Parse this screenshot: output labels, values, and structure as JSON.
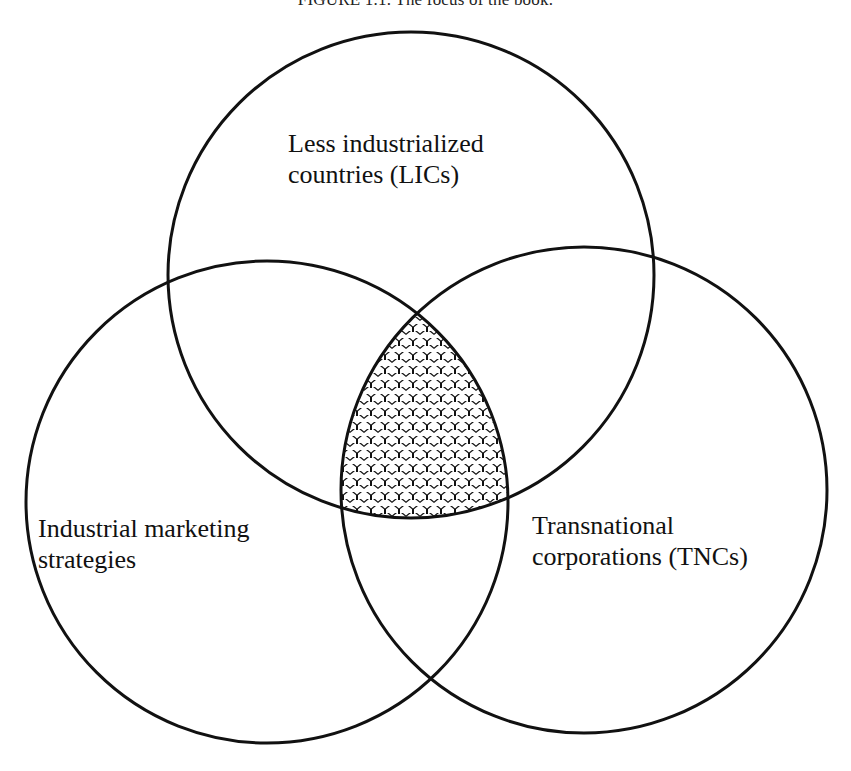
{
  "figure": {
    "title": "FIGURE 1.1. The focus of the book."
  },
  "diagram": {
    "type": "venn",
    "sets": [
      {
        "id": "lics",
        "line1": "Less industrialized",
        "line2": "countries (LICs)",
        "cx": 411,
        "cy": 275,
        "r": 243
      },
      {
        "id": "ims",
        "line1": "Industrial marketing",
        "line2": "strategies",
        "cx": 267,
        "cy": 502,
        "r": 241
      },
      {
        "id": "tncs",
        "line1": "Transnational",
        "line2": "corporations (TNCs)",
        "cx": 584,
        "cy": 490,
        "r": 243
      }
    ],
    "highlighted_region": "intersection of all three sets (hatched)",
    "colors": {
      "stroke": "#111111",
      "background": "#ffffff",
      "pattern": "#111111"
    }
  }
}
